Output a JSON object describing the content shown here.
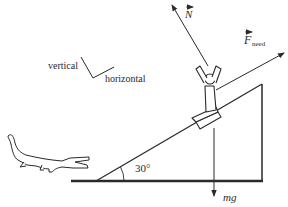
{
  "diagram": {
    "type": "free-body diagram on inclined plane",
    "colors": {
      "ink": "#2a2a2a",
      "background": "#ffffff"
    },
    "axes_hint": {
      "vertical_label": "vertical",
      "horizontal_label": "horizontal"
    },
    "incline": {
      "angle_label": "30°"
    },
    "forces": {
      "normal": {
        "symbol": "N",
        "vector": true
      },
      "applied": {
        "symbol": "F",
        "subscript": "need",
        "vector": true
      },
      "weight": {
        "label": "mg"
      }
    },
    "figures": {
      "person": "person on incline",
      "crocodile": "crocodile at base of incline"
    }
  }
}
